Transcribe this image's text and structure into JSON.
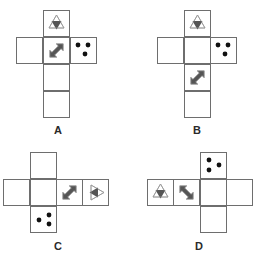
{
  "colors": {
    "line": "#6e6e6e",
    "fill_dark": "#555555",
    "outline_light": "#9a9a9a",
    "dot": "#111111"
  },
  "icons": {
    "triangle-pair": "upward outline triangle overlaid with downward filled triangle",
    "arrow": "double-headed diagonal arrow",
    "dots": "three black dots"
  },
  "nets": [
    {
      "label": "A",
      "label_pos": [
        58,
        124
      ],
      "cells": [
        {
          "x": 43,
          "y": 10,
          "icon": "triangle-pair",
          "rotate": 0
        },
        {
          "x": 16,
          "y": 37,
          "icon": "blank"
        },
        {
          "x": 43,
          "y": 37,
          "icon": "arrow",
          "rotate": 0
        },
        {
          "x": 70,
          "y": 37,
          "icon": "dots",
          "variant": "top-two-bottom-one"
        },
        {
          "x": 43,
          "y": 64,
          "icon": "blank"
        },
        {
          "x": 43,
          "y": 91,
          "icon": "blank"
        }
      ]
    },
    {
      "label": "B",
      "label_pos": [
        197,
        124
      ],
      "cells": [
        {
          "x": 184,
          "y": 10,
          "icon": "triangle-pair",
          "rotate": 0
        },
        {
          "x": 157,
          "y": 37,
          "icon": "blank"
        },
        {
          "x": 184,
          "y": 37,
          "icon": "blank"
        },
        {
          "x": 210,
          "y": 37,
          "icon": "dots",
          "variant": "top-two-bottom-one"
        },
        {
          "x": 184,
          "y": 64,
          "icon": "arrow",
          "rotate": 0
        },
        {
          "x": 184,
          "y": 91,
          "icon": "blank"
        }
      ]
    },
    {
      "label": "C",
      "label_pos": [
        58,
        240
      ],
      "cells": [
        {
          "x": 30,
          "y": 152,
          "icon": "blank"
        },
        {
          "x": 3,
          "y": 179,
          "icon": "blank"
        },
        {
          "x": 30,
          "y": 179,
          "icon": "blank"
        },
        {
          "x": 56,
          "y": 179,
          "icon": "arrow",
          "rotate": 0
        },
        {
          "x": 82,
          "y": 179,
          "icon": "triangle-pair",
          "rotate": 90
        },
        {
          "x": 30,
          "y": 206,
          "icon": "dots",
          "variant": "right-two-left-one"
        }
      ]
    },
    {
      "label": "D",
      "label_pos": [
        199,
        240
      ],
      "cells": [
        {
          "x": 200,
          "y": 152,
          "icon": "dots",
          "variant": "left-two-right-one"
        },
        {
          "x": 147,
          "y": 179,
          "icon": "triangle-pair",
          "rotate": 0
        },
        {
          "x": 173,
          "y": 179,
          "icon": "arrow",
          "rotate": 90
        },
        {
          "x": 200,
          "y": 179,
          "icon": "blank"
        },
        {
          "x": 226,
          "y": 179,
          "icon": "blank"
        },
        {
          "x": 200,
          "y": 206,
          "icon": "blank"
        }
      ]
    }
  ]
}
